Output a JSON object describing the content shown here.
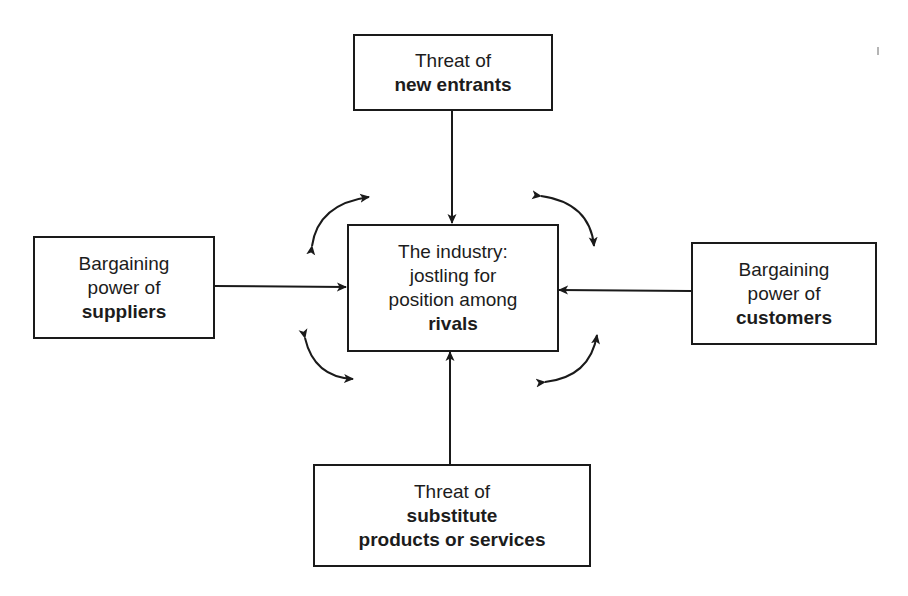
{
  "diagram": {
    "nodes": {
      "top": {
        "id": "new-entrants",
        "lines": [
          "Threat of",
          "new entrants"
        ],
        "bold_lines": [
          1
        ]
      },
      "center": {
        "id": "industry-rivals",
        "lines": [
          "The industry:",
          "jostling for",
          "position among",
          "rivals"
        ],
        "bold_lines": [
          3
        ]
      },
      "left": {
        "id": "suppliers",
        "lines": [
          "Bargaining",
          "power of",
          "suppliers"
        ],
        "bold_lines": [
          2
        ]
      },
      "right": {
        "id": "customers",
        "lines": [
          "Bargaining",
          "power of",
          "customers"
        ],
        "bold_lines": [
          2
        ]
      },
      "bottom": {
        "id": "substitutes",
        "lines": [
          "Threat of",
          "substitute",
          "products or services"
        ],
        "bold_lines": [
          1,
          2
        ]
      }
    },
    "edges": [
      {
        "from": "new-entrants",
        "to": "industry-rivals",
        "style": "straight-arrow"
      },
      {
        "from": "suppliers",
        "to": "industry-rivals",
        "style": "straight-arrow"
      },
      {
        "from": "customers",
        "to": "industry-rivals",
        "style": "straight-arrow"
      },
      {
        "from": "substitutes",
        "to": "industry-rivals",
        "style": "straight-arrow"
      }
    ],
    "rivalry_arrows": [
      "top-left",
      "top-right",
      "bottom-left",
      "bottom-right"
    ],
    "colors": {
      "stroke": "#1a1a1a",
      "background": "#ffffff",
      "text": "#1c1c1c"
    }
  }
}
